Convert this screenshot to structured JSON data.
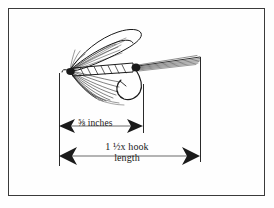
{
  "figure": {
    "kind": "fly-tying-proportion-diagram",
    "background_color": "#fefefe",
    "ink_color": "#1a1a1a",
    "border_color": "#3a3a3a"
  },
  "dimensions": {
    "upper": {
      "name": "body-length-dimension",
      "label": "⅝ inches",
      "fraction": "⅝",
      "unit_text": "inches",
      "arrow_style": "double-headed",
      "left_x": 59,
      "right_x": 143,
      "y": 126
    },
    "lower": {
      "name": "overall-length-dimension",
      "label_line_1": "1 ½x hook",
      "label_line_2": "length",
      "whole": "1",
      "fraction": "½",
      "multiplier_text": "x hook",
      "tail_text": "length",
      "arrow_style": "double-headed",
      "left_x": 59,
      "right_x": 200,
      "y": 156
    }
  },
  "fly_parts": [
    {
      "name": "wing",
      "label": "wing"
    },
    {
      "name": "hackle",
      "label": "hackle"
    },
    {
      "name": "ribbed-body",
      "label": "body"
    },
    {
      "name": "tail",
      "label": "tail"
    },
    {
      "name": "hook",
      "label": "hook"
    }
  ]
}
